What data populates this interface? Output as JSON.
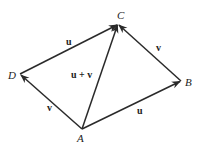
{
  "diagram": {
    "points": {
      "A": {
        "label": "A",
        "x": 82,
        "y": 129
      },
      "B": {
        "label": "B",
        "x": 181,
        "y": 81
      },
      "C": {
        "label": "C",
        "x": 118,
        "y": 24
      },
      "D": {
        "label": "D",
        "x": 20,
        "y": 74
      }
    },
    "edges": [
      {
        "from": "A",
        "to": "B",
        "label": "u"
      },
      {
        "from": "B",
        "to": "C",
        "label": "v"
      },
      {
        "from": "A",
        "to": "D",
        "label": "v"
      },
      {
        "from": "D",
        "to": "C",
        "label": "u"
      },
      {
        "from": "A",
        "to": "C",
        "label": "u + v"
      }
    ],
    "labels": {
      "point_A": "A",
      "point_B": "B",
      "point_C": "C",
      "point_D": "D",
      "edge_AB": "u",
      "edge_BC": "v",
      "edge_AD": "v",
      "edge_DC": "u",
      "edge_AC": "u + v"
    },
    "colors": {
      "stroke": "#2a2a2a",
      "text": "#222222",
      "background": "#ffffff"
    }
  }
}
